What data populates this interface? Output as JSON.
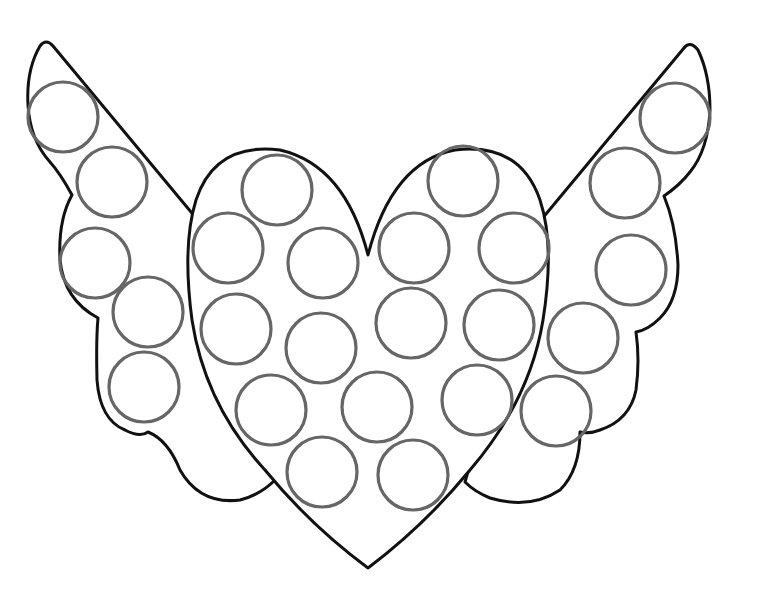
{
  "page": {
    "type": "dot-marker coloring page"
  },
  "colors": {
    "background": "#ffffff",
    "outline": "#111111",
    "dots": "#666666"
  },
  "left_wing_dots": [
    {
      "cx": 63,
      "cy": 117,
      "r": 35
    },
    {
      "cx": 112,
      "cy": 182,
      "r": 35
    },
    {
      "cx": 95,
      "cy": 263,
      "r": 35
    },
    {
      "cx": 148,
      "cy": 312,
      "r": 35
    },
    {
      "cx": 144,
      "cy": 387,
      "r": 35
    }
  ],
  "right_wing_dots": [
    {
      "cx": 675,
      "cy": 118,
      "r": 35
    },
    {
      "cx": 625,
      "cy": 183,
      "r": 35
    },
    {
      "cx": 631,
      "cy": 270,
      "r": 35
    },
    {
      "cx": 583,
      "cy": 338,
      "r": 35
    },
    {
      "cx": 556,
      "cy": 411,
      "r": 35
    }
  ],
  "heart_dots": [
    {
      "cx": 277,
      "cy": 190,
      "r": 35
    },
    {
      "cx": 463,
      "cy": 181,
      "r": 35
    },
    {
      "cx": 228,
      "cy": 248,
      "r": 35
    },
    {
      "cx": 323,
      "cy": 263,
      "r": 35
    },
    {
      "cx": 414,
      "cy": 248,
      "r": 35
    },
    {
      "cx": 514,
      "cy": 248,
      "r": 35
    },
    {
      "cx": 236,
      "cy": 329,
      "r": 35
    },
    {
      "cx": 321,
      "cy": 348,
      "r": 35
    },
    {
      "cx": 411,
      "cy": 323,
      "r": 35
    },
    {
      "cx": 499,
      "cy": 325,
      "r": 35
    },
    {
      "cx": 271,
      "cy": 410,
      "r": 35
    },
    {
      "cx": 377,
      "cy": 407,
      "r": 35
    },
    {
      "cx": 477,
      "cy": 400,
      "r": 35
    },
    {
      "cx": 322,
      "cy": 472,
      "r": 35
    },
    {
      "cx": 413,
      "cy": 475,
      "r": 35
    }
  ]
}
